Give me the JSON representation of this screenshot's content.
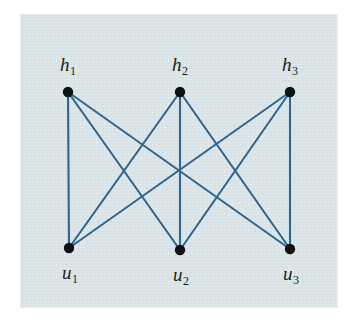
{
  "figure": {
    "kind": "graph-diagram",
    "name": "complete-bipartite-graph-k33",
    "background_color": "#ffffff",
    "plate_color": "#d8e2e5",
    "edge_color": "#2f6693",
    "vertex_color": "#111111",
    "label_color": "#1c1c1c",
    "plate": {
      "x": 20,
      "y": 14,
      "width": 318,
      "height": 294
    }
  },
  "graph_data": {
    "type": "graph",
    "graph_name": "K3,3",
    "directed": false,
    "bipartite": true,
    "vertex_count": 6,
    "edge_count": 9,
    "parts": [
      {
        "part_name": "h",
        "vertex_ids": [
          "h1",
          "h2",
          "h3"
        ]
      },
      {
        "part_name": "u",
        "vertex_ids": [
          "u1",
          "u2",
          "u3"
        ]
      }
    ],
    "vertices": [
      {
        "id": "h1",
        "label_base": "h",
        "label_sub": "1",
        "x": 68,
        "y": 92,
        "label_x": 68,
        "label_y": 66,
        "radius": 5.2
      },
      {
        "id": "h2",
        "label_base": "h",
        "label_sub": "2",
        "x": 180,
        "y": 92,
        "label_x": 180,
        "label_y": 66,
        "radius": 5.2
      },
      {
        "id": "h3",
        "label_base": "h",
        "label_sub": "3",
        "x": 290,
        "y": 92,
        "label_x": 290,
        "label_y": 66,
        "radius": 5.2
      },
      {
        "id": "u1",
        "label_base": "u",
        "label_sub": "1",
        "x": 69,
        "y": 248,
        "label_x": 70,
        "label_y": 274,
        "radius": 5.2
      },
      {
        "id": "u2",
        "label_base": "u",
        "label_sub": "2",
        "x": 180,
        "y": 250,
        "label_x": 181,
        "label_y": 276,
        "radius": 5.2
      },
      {
        "id": "u3",
        "label_base": "u",
        "label_sub": "3",
        "x": 290,
        "y": 249,
        "label_x": 291,
        "label_y": 275,
        "radius": 5.2
      }
    ],
    "edges": [
      {
        "id": "e-h1-u1",
        "source": "h1",
        "target": "u1"
      },
      {
        "id": "e-h1-u2",
        "source": "h1",
        "target": "u2"
      },
      {
        "id": "e-h1-u3",
        "source": "h1",
        "target": "u3"
      },
      {
        "id": "e-h2-u1",
        "source": "h2",
        "target": "u1"
      },
      {
        "id": "e-h2-u2",
        "source": "h2",
        "target": "u2"
      },
      {
        "id": "e-h2-u3",
        "source": "h2",
        "target": "u3"
      },
      {
        "id": "e-h3-u1",
        "source": "h3",
        "target": "u1"
      },
      {
        "id": "e-h3-u2",
        "source": "h3",
        "target": "u2"
      },
      {
        "id": "e-h3-u3",
        "source": "h3",
        "target": "u3"
      }
    ],
    "edge_stroke_width": 2.1
  }
}
